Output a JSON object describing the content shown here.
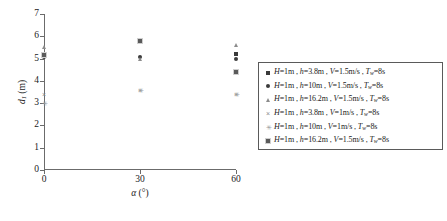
{
  "chart_data": {
    "type": "scatter",
    "title": "",
    "xlabel": "α (°)",
    "ylabel": "d₁ (m)",
    "xlim": [
      0,
      60
    ],
    "ylim": [
      0,
      7
    ],
    "xticks": [
      "0",
      "30",
      "60"
    ],
    "yticks": [
      "0",
      "1",
      "2",
      "3",
      "4",
      "5",
      "6",
      "7"
    ],
    "grid": false,
    "legend_position": "right-outside",
    "series": [
      {
        "name": "H=1m, h=3.8m, V=1.5m/s, Tw=8s",
        "marker": "filled-square",
        "points": [
          {
            "x": 0,
            "y": 5.1
          },
          {
            "x": 30,
            "y": 5.8
          },
          {
            "x": 60,
            "y": 5.2
          }
        ]
      },
      {
        "name": "H=1m, h=10m, V=1.5m/s, Tw=8s",
        "marker": "filled-circle",
        "points": [
          {
            "x": 0,
            "y": 5.05
          },
          {
            "x": 30,
            "y": 5.05
          },
          {
            "x": 60,
            "y": 5.0
          }
        ]
      },
      {
        "name": "H=1m, h=16.2m, V=1.5m/s, Tw=8s",
        "marker": "triangle",
        "points": [
          {
            "x": 0,
            "y": 5.5
          },
          {
            "x": 30,
            "y": 5.0
          },
          {
            "x": 60,
            "y": 5.6
          }
        ]
      },
      {
        "name": "H=1m, h=3.8m, V=1m/s, Tw=8s",
        "marker": "cross",
        "points": [
          {
            "x": 0,
            "y": 3.4
          },
          {
            "x": 30,
            "y": 3.6
          },
          {
            "x": 60,
            "y": 3.4
          }
        ]
      },
      {
        "name": "H=1m, h=10m, V=1m/s, Tw=8s",
        "marker": "star-cross",
        "points": [
          {
            "x": 0,
            "y": 3.0
          },
          {
            "x": 30,
            "y": 3.6
          },
          {
            "x": 60,
            "y": 3.4
          }
        ]
      },
      {
        "name": "H=1m, h=16.2m, V=1.5m/s, Tw=8s",
        "marker": "boxed-square",
        "points": [
          {
            "x": 0,
            "y": 5.15
          },
          {
            "x": 30,
            "y": 5.8
          },
          {
            "x": 60,
            "y": 4.4
          }
        ]
      }
    ]
  },
  "axes": {
    "y_title_main": "d",
    "y_title_sub": "1",
    "y_title_unit": " (m)",
    "x_title_main": "α",
    "x_title_unit": " (°)",
    "yticks": [
      "7",
      "6",
      "5",
      "4",
      "3",
      "2",
      "1",
      "0"
    ],
    "xticks": [
      "0",
      "30",
      "60"
    ]
  },
  "legend": {
    "entries": [
      {
        "marker": "filled-square",
        "H": "H",
        "H_val": "=1m",
        "h": "h",
        "h_val": "=3.8m",
        "V": "V",
        "V_val": "=1.5m/s",
        "T": "T",
        "T_sub": "w",
        "T_val": "=8s"
      },
      {
        "marker": "filled-circle",
        "H": "H",
        "H_val": "=1m",
        "h": "h",
        "h_val": "=10m",
        "V": "V",
        "V_val": "=1.5m/s",
        "T": "T",
        "T_sub": "w",
        "T_val": "=8s"
      },
      {
        "marker": "triangle",
        "H": "H",
        "H_val": "=1m",
        "h": "h",
        "h_val": "=16.2m",
        "V": "V",
        "V_val": "=1.5m/s",
        "T": "T",
        "T_sub": "w",
        "T_val": "=8s"
      },
      {
        "marker": "cross",
        "H": "H",
        "H_val": "=1m",
        "h": "h",
        "h_val": "=3.8m",
        "V": "V",
        "V_val": "=1m/s",
        "T": "T",
        "T_sub": "w",
        "T_val": "=8s"
      },
      {
        "marker": "star-cross",
        "H": "H",
        "H_val": "=1m",
        "h": "h",
        "h_val": "=10m",
        "V": "V",
        "V_val": "=1m/s",
        "T": "T",
        "T_sub": "w",
        "T_val": "=8s"
      },
      {
        "marker": "boxed-square",
        "H": "H",
        "H_val": "=1m",
        "h": "h",
        "h_val": "=16.2m",
        "V": "V",
        "V_val": "=1.5m/s",
        "T": "T",
        "T_sub": "w",
        "T_val": "=8s"
      }
    ],
    "separator": " , "
  },
  "colors": {
    "axis": "#6b6b6b",
    "marker_dark": "#3a3a3a",
    "marker_mid": "#5a5a5a",
    "marker_light": "#8c8c8c",
    "legend_border": "#5a5a5a",
    "background": "#ffffff"
  }
}
